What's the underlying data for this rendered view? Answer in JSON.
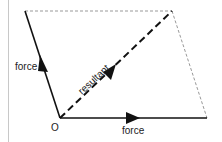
{
  "diagram": {
    "labels": {
      "force_left": "force",
      "force_bottom": "force",
      "resultant": "resultant",
      "origin": "O"
    },
    "points": {
      "origin": [
        60,
        118
      ],
      "left_top": [
        25,
        11
      ],
      "right_top": [
        172,
        11
      ],
      "right_bottom": [
        207,
        118
      ]
    },
    "colors": {
      "solid_line": "#111111",
      "dashed_line": "#111111",
      "dotted_line": "#999999",
      "border": "#c8c8c8"
    }
  }
}
